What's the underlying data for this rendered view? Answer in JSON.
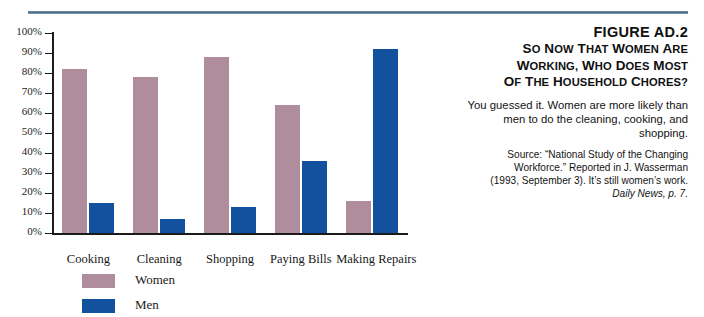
{
  "figure": {
    "number": "FIGURE AD.2",
    "title_lines": [
      "So Now That Women Are",
      "Working, Who Does Most",
      "of the Household Chores?"
    ],
    "body": "You guessed it. Women are more likely than men to do the cleaning, cooking, and shopping.",
    "source_lines": [
      "Source: “National Study of the Changing",
      "Workforce.” Reported in J. Wasserman",
      "(1993, September 3). It’s still women’s work."
    ],
    "source_italic": "Daily News, p. 7."
  },
  "colors": {
    "women": "#b08d9c",
    "men": "#12519d",
    "axis": "#1b1b1b",
    "rule": "#4d6b84"
  },
  "legend": {
    "items": [
      {
        "label": "Women",
        "color": "#b08d9c"
      },
      {
        "label": "Men",
        "color": "#12519d"
      }
    ]
  },
  "chart_data": {
    "type": "bar",
    "title": "So Now That Women Are Working, Who Does Most of the Household Chores?",
    "xlabel": "",
    "ylabel": "",
    "ylim": [
      0,
      100
    ],
    "grid": false,
    "legend_position": "bottom-left",
    "categories": [
      "Cooking",
      "Cleaning",
      "Shopping",
      "Paying Bills",
      "Making Repairs"
    ],
    "ticks": [
      "0%",
      "10%",
      "20%",
      "30%",
      "40%",
      "50%",
      "60%",
      "70%",
      "80%",
      "90%",
      "100%"
    ],
    "tick_values": [
      0,
      10,
      20,
      30,
      40,
      50,
      60,
      70,
      80,
      90,
      100
    ],
    "series": [
      {
        "name": "Women",
        "color": "#b08d9c",
        "values": [
          82,
          78,
          88,
          64,
          16
        ]
      },
      {
        "name": "Men",
        "color": "#12519d",
        "values": [
          15,
          7,
          13,
          36,
          92
        ]
      }
    ]
  }
}
